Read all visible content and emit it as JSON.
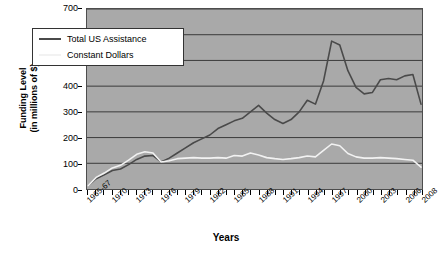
{
  "chart_data": {
    "type": "line",
    "title": "",
    "xlabel": "Years",
    "ylabel": "Funding Level\n(in millions of $)",
    "ylabel_line1": "Funding Level",
    "ylabel_line2": "(in millions of $)",
    "ylim": [
      0,
      700
    ],
    "ytick_values": [
      0,
      100,
      200,
      300,
      400,
      500,
      600,
      700
    ],
    "ytick_labels": [
      "0",
      "100",
      "200",
      "300",
      "400",
      "500",
      "600",
      "700"
    ],
    "grid": true,
    "grid_axis": "y",
    "legend_position": "upper-left-inside",
    "plot_background": "#a9a9a9",
    "x": [
      "1965-67",
      "1968",
      "1969",
      "1970",
      "1971",
      "1972",
      "1973",
      "1974",
      "1975",
      "1976",
      "1977",
      "1978",
      "1979",
      "1980",
      "1981",
      "1982",
      "1983",
      "1984",
      "1985",
      "1986",
      "1987",
      "1988",
      "1989",
      "1990",
      "1991",
      "1992",
      "1993",
      "1994",
      "1995",
      "1996",
      "1997",
      "1998",
      "1999",
      "2000",
      "2001",
      "2002",
      "2003",
      "2004",
      "2005",
      "2006",
      "2007",
      "2008"
    ],
    "xtick_labels": [
      "1965-67",
      "1970",
      "1973",
      "1976",
      "1979",
      "1982",
      "1985",
      "1988",
      "1991",
      "1994",
      "1997",
      "2000",
      "2003",
      "2006",
      "2008"
    ],
    "xtick_indices": [
      0,
      3,
      6,
      9,
      12,
      15,
      18,
      21,
      24,
      27,
      30,
      33,
      36,
      39,
      41
    ],
    "series": [
      {
        "name": "Total US Assistance",
        "color": "#4a4a4a",
        "values": [
          12,
          40,
          55,
          72,
          78,
          95,
          115,
          128,
          130,
          105,
          120,
          140,
          160,
          180,
          195,
          210,
          235,
          250,
          265,
          275,
          300,
          325,
          295,
          270,
          255,
          270,
          300,
          345,
          330,
          420,
          575,
          560,
          460,
          395,
          370,
          375,
          425,
          430,
          425,
          440,
          445,
          330
        ]
      },
      {
        "name": "Constant Dollars",
        "color": "#f2f2f2",
        "values": [
          12,
          45,
          62,
          82,
          92,
          112,
          135,
          145,
          140,
          105,
          110,
          118,
          120,
          122,
          120,
          120,
          122,
          120,
          130,
          128,
          140,
          132,
          122,
          118,
          115,
          118,
          122,
          128,
          125,
          150,
          175,
          168,
          138,
          125,
          120,
          120,
          122,
          120,
          118,
          115,
          112,
          85
        ]
      }
    ]
  },
  "legend": {
    "items": [
      {
        "label": "Total US Assistance",
        "color": "#4a4a4a"
      },
      {
        "label": "Constant Dollars",
        "color": "#f2f2f2"
      }
    ]
  }
}
